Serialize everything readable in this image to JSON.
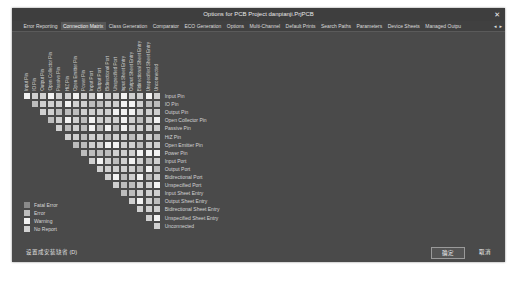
{
  "window": {
    "title": "Options for PCB Project danpianji.PrjPCB",
    "close_glyph": "✕"
  },
  "tabs": [
    {
      "label": "Error Reporting",
      "active": false
    },
    {
      "label": "Connection Matrix",
      "active": true
    },
    {
      "label": "Class Generation",
      "active": false
    },
    {
      "label": "Comparator",
      "active": false
    },
    {
      "label": "ECO Generation",
      "active": false
    },
    {
      "label": "Options",
      "active": false
    },
    {
      "label": "Multi-Channel",
      "active": false
    },
    {
      "label": "Default Prints",
      "active": false
    },
    {
      "label": "Search Paths",
      "active": false
    },
    {
      "label": "Parameters",
      "active": false
    },
    {
      "label": "Device Sheets",
      "active": false
    },
    {
      "label": "Managed Outpu",
      "active": false
    }
  ],
  "tab_scroll": {
    "left": "◂",
    "right": "▸"
  },
  "matrix": {
    "labels": [
      "Input Pin",
      "IO Pin",
      "Output Pin",
      "Open Collector Pin",
      "Passive Pin",
      "HiZ Pin",
      "Open Emitter Pin",
      "Power Pin",
      "Input Port",
      "Output Port",
      "Bidirectional Port",
      "Unspecified Port",
      "Input Sheet Entry",
      "Output Sheet Entry",
      "Bidirectional Sheet Entry",
      "Unspecified Sheet Entry",
      "Unconnected"
    ],
    "legend_colors": {
      "fatal_error": "#8a8a8a",
      "error": "#bdbdbd",
      "warning": "#f2f2f2",
      "no_report": "#d2d2d2"
    }
  },
  "legend": [
    {
      "label": "Fatal Error",
      "color": "#8a8a8a"
    },
    {
      "label": "Error",
      "color": "#bdbdbd"
    },
    {
      "label": "Warning",
      "color": "#f2f2f2"
    },
    {
      "label": "No Report",
      "color": "#d2d2d2"
    }
  ],
  "footer": {
    "reset_label": "设置成安装缺省 (D)",
    "ok_label": "确定",
    "cancel_label": "取消"
  },
  "colors": {
    "dialog_bg": "#4a4a4a",
    "titlebar_bg": "#3e3e3e",
    "active_tab_bg": "#575757"
  }
}
